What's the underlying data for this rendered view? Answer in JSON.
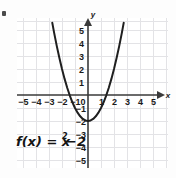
{
  "figure": {
    "name": "parabola-graph",
    "function_label": "f(x) = x",
    "function_exponent": "2",
    "function_tail": "−2",
    "colors": {
      "background": "#fdfdfd",
      "grid": "#e3e3e6",
      "axis": "#3a3a3a",
      "curve": "#1f1f1f",
      "text": "#1a1a1a"
    }
  },
  "chart_data": {
    "type": "line",
    "title": "",
    "subtitle": "",
    "xlabel": "x",
    "ylabel": "y",
    "grid": true,
    "legend": "none",
    "equation": "f(x) = x^2 - 2",
    "xlim": [
      -5.5,
      5.5
    ],
    "ylim": [
      -5.5,
      5.5
    ],
    "x_ticks": [
      -5,
      -4,
      -3,
      -2,
      -1,
      0,
      1,
      2,
      3,
      4,
      5
    ],
    "x_tick_labels": [
      "−5",
      "−4",
      "−3",
      "−2",
      "−1",
      "0",
      "1",
      "2",
      "3",
      "4",
      "5"
    ],
    "y_ticks": [
      -5,
      -4,
      -3,
      -2,
      -1,
      1,
      2,
      3,
      4,
      5
    ],
    "y_tick_labels": [
      "−5",
      "−4",
      "−3",
      "−2",
      "−1",
      "1",
      "2",
      "3",
      "4",
      "5"
    ],
    "vertex": [
      0,
      -2
    ],
    "roots": [
      -1.414,
      1.414
    ],
    "series": [
      {
        "name": "f(x) = x^2 - 2",
        "x": [
          -2.75,
          -2.6,
          -2.4,
          -2.2,
          -2.0,
          -1.8,
          -1.6,
          -1.4,
          -1.2,
          -1.0,
          -0.8,
          -0.6,
          -0.4,
          -0.2,
          0,
          0.2,
          0.4,
          0.6,
          0.8,
          1.0,
          1.2,
          1.4,
          1.6,
          1.8,
          2.0,
          2.2,
          2.4,
          2.6,
          2.75
        ],
        "values": [
          5.5625,
          4.76,
          3.76,
          2.84,
          2.0,
          1.24,
          0.56,
          -0.04,
          -0.56,
          -1.0,
          -1.36,
          -1.64,
          -1.84,
          -1.96,
          -2.0,
          -1.96,
          -1.84,
          -1.64,
          -1.36,
          -1.0,
          -0.56,
          -0.04,
          0.56,
          1.24,
          2.0,
          2.84,
          3.76,
          4.76,
          5.5625
        ]
      }
    ]
  }
}
